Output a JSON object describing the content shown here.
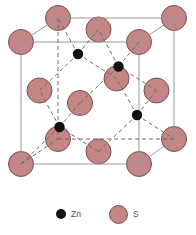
{
  "diagram": {
    "background": "#ffffff",
    "edge_color": "#979797",
    "hidden_edge_color": "#6b6b6b",
    "bond_color": "#6b6b6b",
    "dash": "4 3",
    "s_fill": "#c48585",
    "s_stroke": "#7a4f4f",
    "zn_fill": "#121212",
    "s_radius": 12.5,
    "zn_radius": 5.2,
    "s_atoms": [
      [
        21,
        164
      ],
      [
        139,
        164
      ],
      [
        21,
        42
      ],
      [
        139,
        42
      ],
      [
        58,
        139
      ],
      [
        174,
        139
      ],
      [
        58,
        18
      ],
      [
        174,
        18
      ],
      [
        98.5,
        29.5
      ],
      [
        98.5,
        151.5
      ],
      [
        39.5,
        90.5
      ],
      [
        156.5,
        90.5
      ],
      [
        80,
        103
      ],
      [
        116.5,
        78.5
      ]
    ],
    "zn_atoms": [
      [
        59.5,
        127
      ],
      [
        137,
        115
      ],
      [
        78,
        54
      ],
      [
        118.5,
        66.5
      ]
    ],
    "solid_edges": [
      [
        21,
        42,
        139,
        42
      ],
      [
        139,
        42,
        139,
        164
      ],
      [
        139,
        164,
        21,
        164
      ],
      [
        21,
        164,
        21,
        42
      ],
      [
        58,
        18,
        174,
        18
      ],
      [
        174,
        18,
        174,
        139
      ],
      [
        21,
        42,
        58,
        18
      ],
      [
        139,
        42,
        174,
        18
      ],
      [
        139,
        164,
        174,
        139
      ]
    ],
    "dashed_edges": [
      [
        58,
        18,
        58,
        139
      ],
      [
        58,
        139,
        174,
        139
      ],
      [
        21,
        164,
        58,
        139
      ]
    ],
    "bonds": [
      [
        59.5,
        127,
        21,
        164
      ],
      [
        59.5,
        127,
        98.5,
        151.5
      ],
      [
        59.5,
        127,
        80,
        103
      ],
      [
        59.5,
        127,
        39.5,
        90.5
      ],
      [
        137,
        115,
        174,
        139
      ],
      [
        137,
        115,
        98.5,
        151.5
      ],
      [
        137,
        115,
        116.5,
        78.5
      ],
      [
        137,
        115,
        156.5,
        90.5
      ],
      [
        78,
        54,
        58,
        18
      ],
      [
        78,
        54,
        98.5,
        29.5
      ],
      [
        78,
        54,
        116.5,
        78.5
      ],
      [
        78,
        54,
        39.5,
        90.5
      ],
      [
        118.5,
        66.5,
        139,
        42
      ],
      [
        118.5,
        66.5,
        98.5,
        29.5
      ],
      [
        118.5,
        66.5,
        80,
        103
      ],
      [
        118.5,
        66.5,
        156.5,
        90.5
      ]
    ]
  },
  "legend": {
    "items": [
      {
        "label": "Zn",
        "color": "#121212"
      },
      {
        "label": "S",
        "color": "#c48585",
        "stroke": "#7a4f4f"
      }
    ]
  }
}
